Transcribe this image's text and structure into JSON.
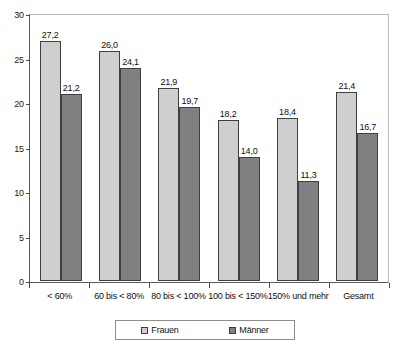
{
  "chart_data": {
    "type": "bar",
    "title": "",
    "subtitle": "",
    "xlabel": "",
    "ylabel": "",
    "ylim": [
      0,
      30
    ],
    "yticks": [
      "0",
      "5",
      "10",
      "15",
      "20",
      "25",
      "30"
    ],
    "ytick_values": [
      0,
      5,
      10,
      15,
      20,
      25,
      30
    ],
    "grid": false,
    "legend_position": "bottom",
    "decimal_separator": ",",
    "categories": [
      "< 60%",
      "60 bis < 80%",
      "80 bis < 100%",
      "100 bis < 150%",
      "150% und mehr",
      "Gesamt"
    ],
    "series": [
      {
        "name": "Frauen",
        "color": "#cfcfcf",
        "values": [
          27.2,
          26.0,
          21.9,
          18.2,
          18.4,
          21.4
        ],
        "labels": [
          "27,2",
          "26,0",
          "21,9",
          "18,2",
          "18,4",
          "21,4"
        ]
      },
      {
        "name": "Männer",
        "color": "#808080",
        "values": [
          21.2,
          24.1,
          19.7,
          14.0,
          11.3,
          16.7
        ],
        "labels": [
          "21,2",
          "24,1",
          "19,7",
          "14,0",
          "11,3",
          "16,7"
        ]
      }
    ]
  },
  "legend": {
    "items": [
      {
        "label": "Frauen"
      },
      {
        "label": "Männer"
      }
    ]
  }
}
